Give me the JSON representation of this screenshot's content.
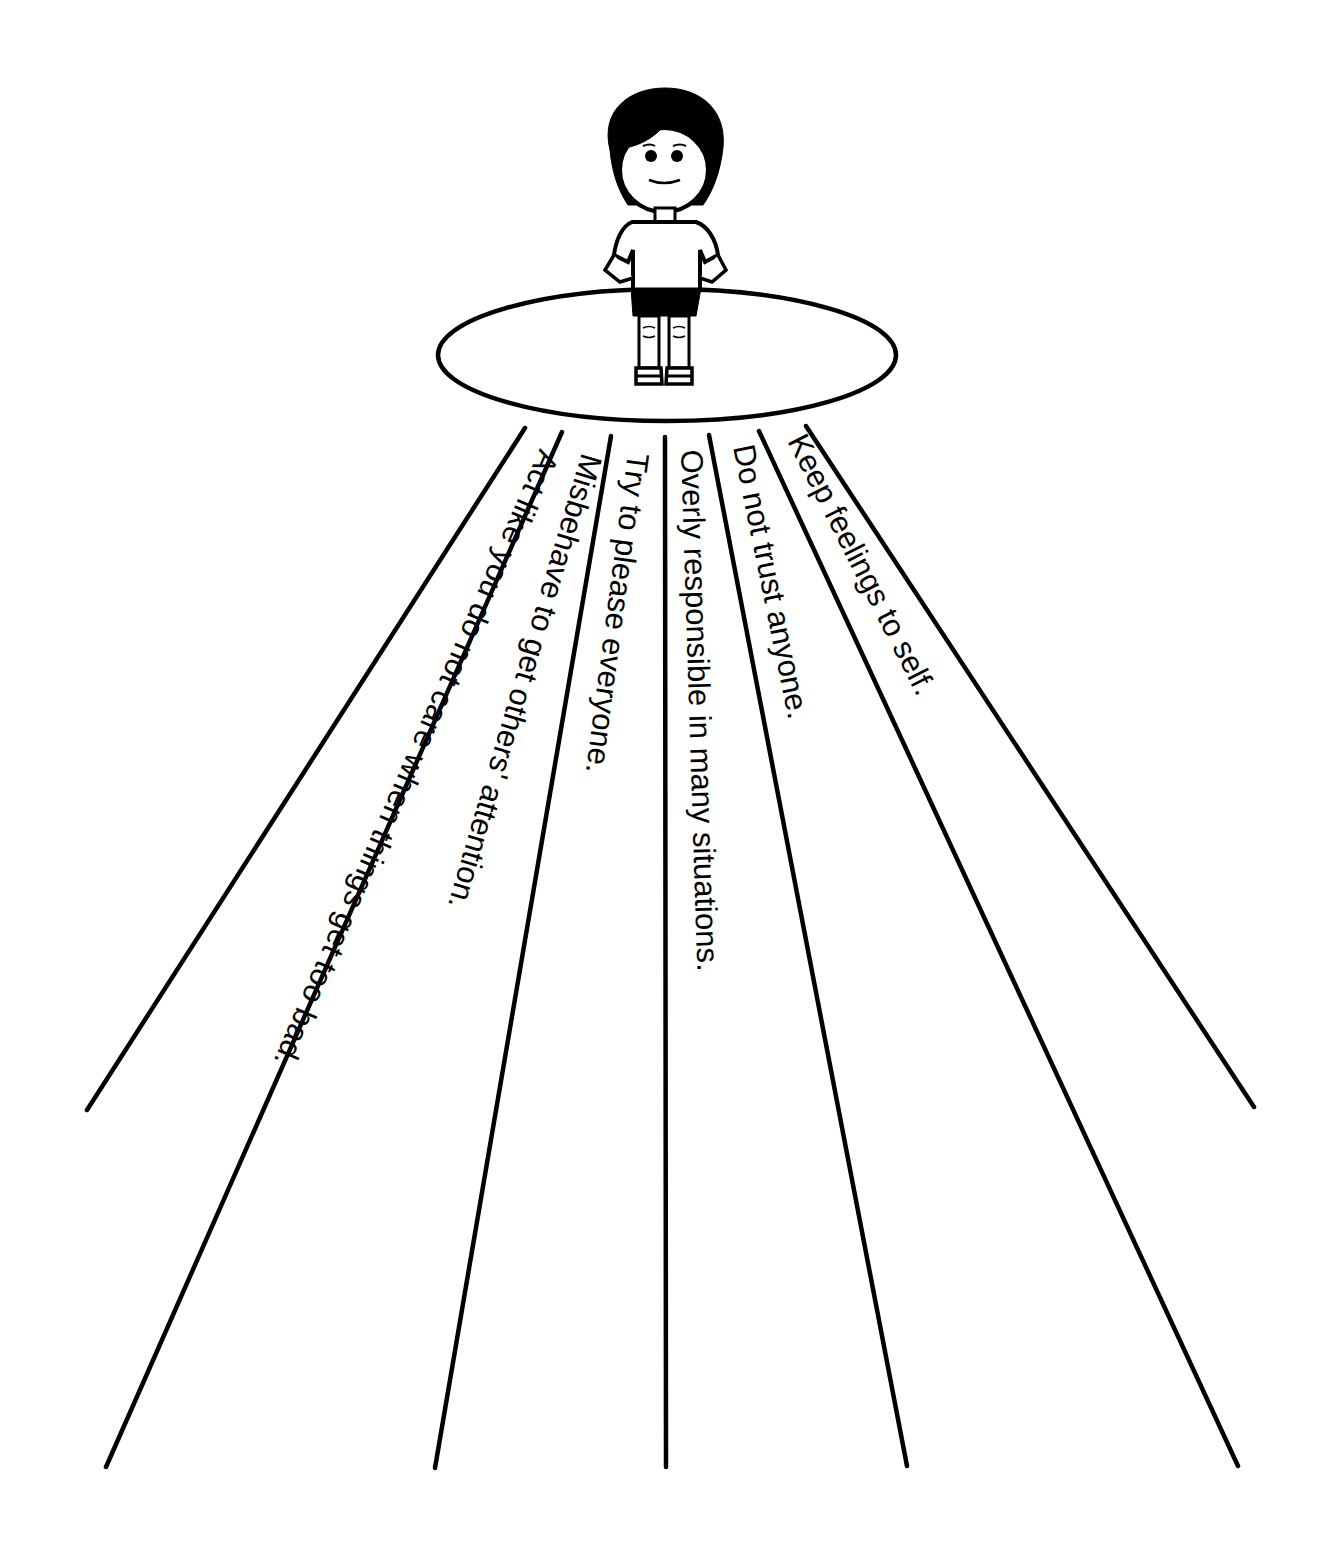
{
  "diagram": {
    "type": "radiating-path-worksheet",
    "center_figure": "child-standing-on-platform",
    "platform_shape": "ellipse",
    "paths": [
      {
        "label": "Act like you do not care when things get too bad."
      },
      {
        "label": "Misbehave to get others' attention."
      },
      {
        "label": "Try to please everyone."
      },
      {
        "label": "Overly responsible in many situations."
      },
      {
        "label": "Do not trust anyone."
      },
      {
        "label": "Keep feelings to self."
      }
    ],
    "colors": {
      "line": "#000000",
      "background": "#ffffff"
    }
  }
}
